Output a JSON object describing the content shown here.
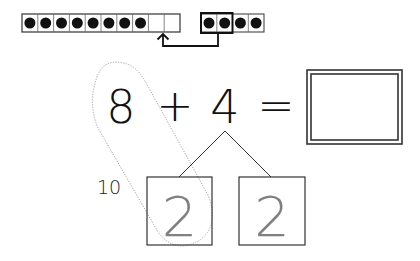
{
  "ten_frame": {
    "cells": 10,
    "filled": 8
  },
  "four_frame": {
    "cells": 4,
    "filled": 4,
    "highlighted": 2
  },
  "equation": {
    "addend1": "8",
    "plus": "+",
    "addend2": "4",
    "equals": "=",
    "answer": ""
  },
  "decomposition": {
    "part1": "2",
    "part2": "2",
    "make_ten_label": "10"
  },
  "colors": {
    "ink": "#222222",
    "gray_digit": "#808080",
    "dotted_loop": "#999999"
  }
}
